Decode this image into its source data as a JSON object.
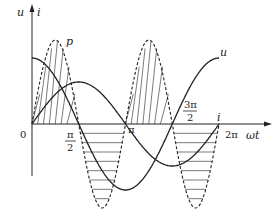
{
  "axes": {
    "y_labels": [
      "u",
      "i"
    ],
    "x_label": "ωt",
    "origin_label": "0",
    "ticks": [
      {
        "num": "π",
        "den": "2"
      },
      {
        "num": "π",
        "den": ""
      },
      {
        "num": "3π",
        "den": "2"
      },
      {
        "num": "2π",
        "den": ""
      }
    ]
  },
  "curves": {
    "voltage_label": "u",
    "current_label": "i",
    "power_label": "p"
  },
  "colors": {
    "ink": "#222222"
  }
}
